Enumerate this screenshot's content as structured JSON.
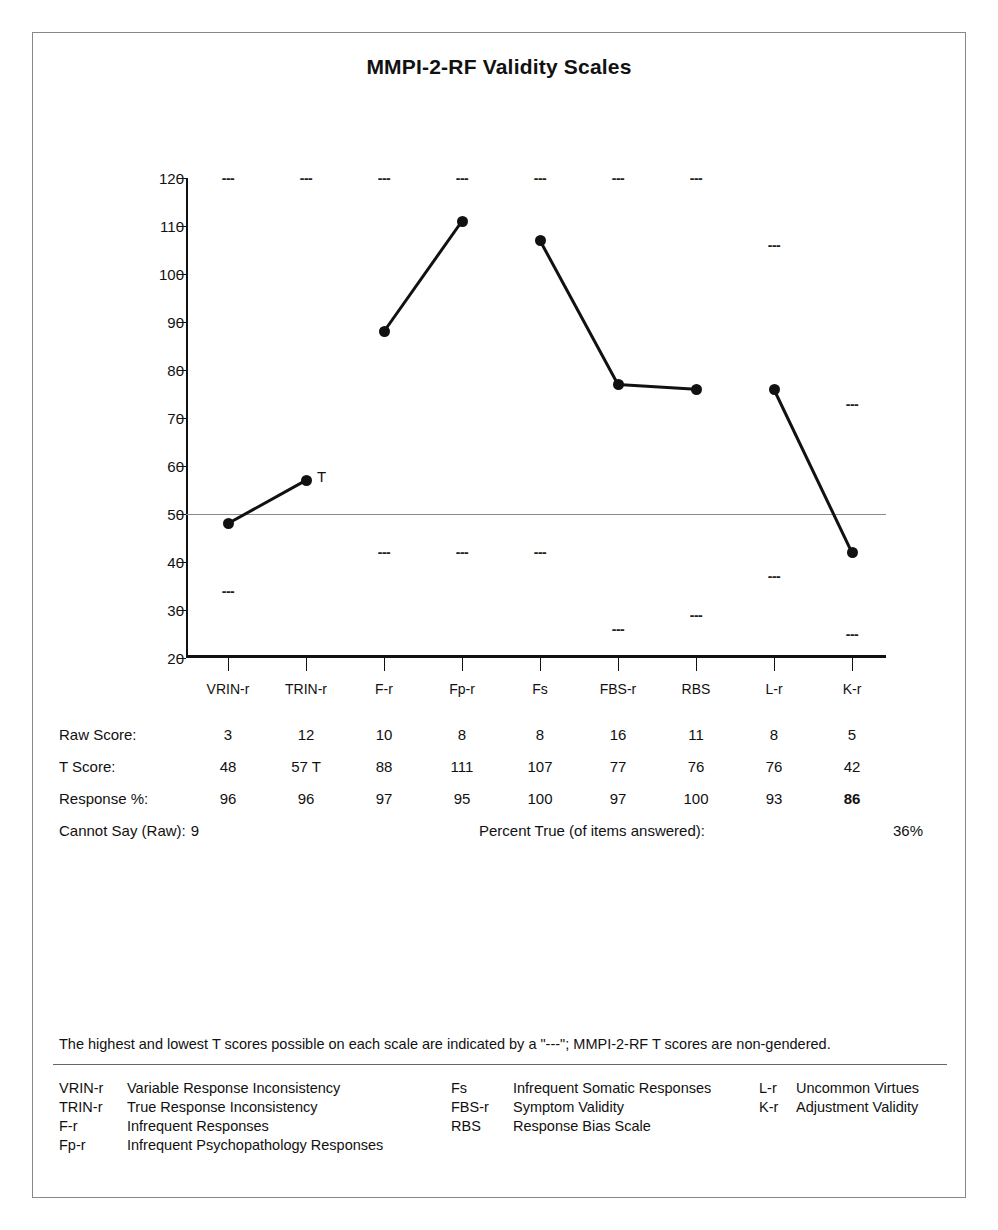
{
  "title": "MMPI-2-RF Validity Scales",
  "chart_data": {
    "type": "line",
    "title": "MMPI-2-RF Validity Scales",
    "xlabel": "",
    "ylabel": "T Score",
    "ylim": [
      20,
      120
    ],
    "yticks": [
      20,
      30,
      40,
      50,
      60,
      70,
      80,
      90,
      100,
      110,
      120
    ],
    "grid": false,
    "reference_line": 50,
    "legend_position": "none",
    "categories": [
      "VRIN-r",
      "TRIN-r",
      "F-r",
      "Fp-r",
      "Fs",
      "FBS-r",
      "RBS",
      "L-r",
      "K-r"
    ],
    "series": [
      {
        "name": "T Score",
        "values": [
          48,
          57,
          88,
          111,
          107,
          77,
          76,
          76,
          42
        ],
        "segments": [
          [
            0,
            1
          ],
          [
            2,
            3
          ],
          [
            4,
            5
          ],
          [
            5,
            6
          ],
          [
            7,
            8
          ]
        ]
      }
    ],
    "annotations": [
      {
        "category": "TRIN-r",
        "value": 57,
        "text": "T"
      }
    ],
    "max_markers": [
      120,
      120,
      120,
      120,
      120,
      120,
      120,
      106,
      73
    ],
    "min_markers": [
      34,
      null,
      42,
      42,
      42,
      26,
      29,
      37,
      25
    ],
    "marker_symbol": "---"
  },
  "table": {
    "rows": [
      {
        "label": "Raw Score:",
        "values": [
          "3",
          "12",
          "10",
          "8",
          "8",
          "16",
          "11",
          "8",
          "5"
        ],
        "bold": [
          false,
          false,
          false,
          false,
          false,
          false,
          false,
          false,
          false
        ]
      },
      {
        "label": "T Score:",
        "values": [
          "48",
          "57 T",
          "88",
          "111",
          "107",
          "77",
          "76",
          "76",
          "42"
        ],
        "bold": [
          false,
          false,
          false,
          false,
          false,
          false,
          false,
          false,
          false
        ]
      },
      {
        "label": "Response %:",
        "values": [
          "96",
          "96",
          "97",
          "95",
          "100",
          "97",
          "100",
          "93",
          "86"
        ],
        "bold": [
          false,
          false,
          false,
          false,
          false,
          false,
          false,
          false,
          true
        ]
      }
    ],
    "summary": {
      "cannot_say_label": "Cannot Say (Raw):",
      "cannot_say_value": "9",
      "percent_true_label": "Percent True (of items answered):",
      "percent_true_value": "36%"
    }
  },
  "footnote": "The highest and lowest T scores possible on each scale are indicated by a \"---\"; MMPI-2-RF T scores are non-gendered.",
  "legend": {
    "col1": [
      {
        "abbr": "VRIN-r",
        "name": "Variable Response Inconsistency"
      },
      {
        "abbr": "TRIN-r",
        "name": "True Response Inconsistency"
      },
      {
        "abbr": "F-r",
        "name": "Infrequent Responses"
      },
      {
        "abbr": "Fp-r",
        "name": "Infrequent Psychopathology Responses"
      }
    ],
    "col2": [
      {
        "abbr": "Fs",
        "name": "Infrequent Somatic Responses"
      },
      {
        "abbr": "FBS-r",
        "name": "Symptom Validity"
      },
      {
        "abbr": "RBS",
        "name": "Response Bias Scale"
      }
    ],
    "col3": [
      {
        "abbr": "L-r",
        "name": "Uncommon Virtues"
      },
      {
        "abbr": "K-r",
        "name": "Adjustment Validity"
      }
    ]
  },
  "colors": {
    "line": "#111111",
    "frame": "#888888",
    "reference_line": "#8a8a8a"
  }
}
